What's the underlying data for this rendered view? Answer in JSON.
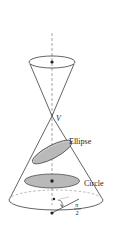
{
  "diagram": {
    "type": "double-cone-conic-sections",
    "labels": {
      "vertex": "V",
      "ellipse": "Ellipse",
      "circle": "Circle",
      "angle_num": "π",
      "angle_den": "2"
    },
    "colors": {
      "stroke": "#231f20",
      "fill_section": "#b9b9b9",
      "axis": "#9a9a9a",
      "background": "#ffffff"
    }
  }
}
